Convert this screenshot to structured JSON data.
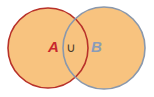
{
  "diagram": {
    "type": "venn-union",
    "fill_color": "#f8c37f",
    "sets": [
      {
        "label": "A",
        "stroke_color": "#b8322a",
        "label_color": "#c8282e",
        "cx": 48,
        "cy": 48,
        "r": 40
      },
      {
        "label": "B",
        "stroke_color": "#8a98ac",
        "label_color": "#8a9cb8",
        "cx": 104,
        "cy": 48,
        "r": 41
      }
    ],
    "operator": {
      "symbol": "∪",
      "color": "#4a3a2a"
    }
  }
}
